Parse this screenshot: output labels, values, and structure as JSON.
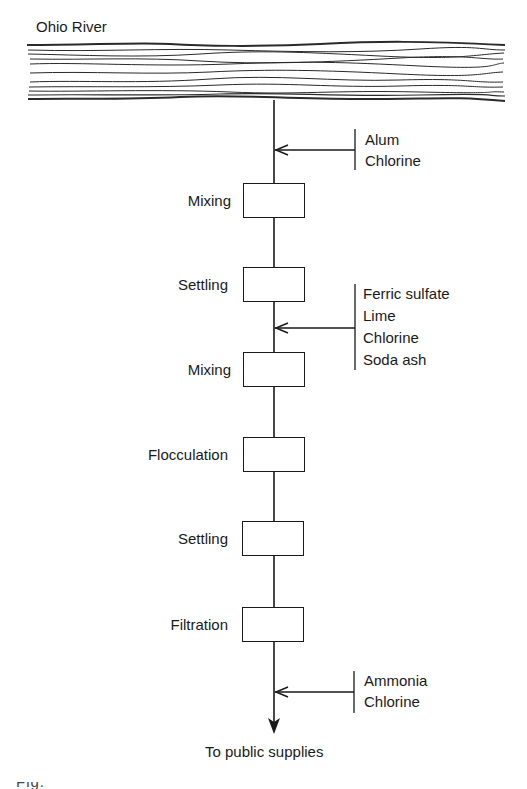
{
  "diagram": {
    "title": "Ohio River",
    "source_label": "Ohio River",
    "stages": [
      {
        "label": "Mixing"
      },
      {
        "label": "Settling"
      },
      {
        "label": "Mixing"
      },
      {
        "label": "Flocculation"
      },
      {
        "label": "Settling"
      },
      {
        "label": "Filtration"
      }
    ],
    "chemical_inputs": [
      {
        "position": "before Mixing",
        "chemicals": [
          "Alum",
          "Chlorine"
        ]
      },
      {
        "position": "between Settling and Mixing",
        "chemicals": [
          "Ferric sulfate",
          "Lime",
          "Chlorine",
          "Soda ash"
        ]
      },
      {
        "position": "after Filtration",
        "chemicals": [
          "Ammonia",
          "Chlorine"
        ]
      }
    ],
    "output_label": "To public supplies",
    "caption_partial": "Fig."
  }
}
